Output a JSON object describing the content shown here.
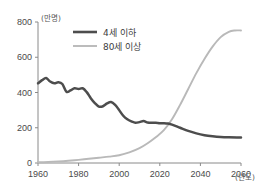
{
  "chart_data": {
    "type": "line",
    "title": "",
    "xlabel": "(년도)",
    "ylabel": "(만명)",
    "xlim": [
      1960,
      2060
    ],
    "ylim": [
      0,
      800
    ],
    "grid": false,
    "legend_position": "top-center",
    "x_ticks": [
      "1960",
      "1980",
      "2000",
      "2020",
      "2040",
      "2060"
    ],
    "x_tick_values": [
      1960,
      1980,
      2000,
      2020,
      2040,
      2060
    ],
    "y_ticks": [
      "0",
      "200",
      "400",
      "600",
      "800"
    ],
    "y_tick_values": [
      0,
      200,
      400,
      600,
      800
    ],
    "series": [
      {
        "name": "4세 이하",
        "color": "#4d4d4d",
        "x": [
          1960,
          1962,
          1964,
          1966,
          1968,
          1970,
          1972,
          1974,
          1976,
          1978,
          1980,
          1982,
          1984,
          1986,
          1988,
          1990,
          1992,
          1994,
          1996,
          1998,
          2000,
          2002,
          2004,
          2006,
          2008,
          2010,
          2012,
          2014,
          2016,
          2018,
          2020,
          2022,
          2024,
          2026,
          2030,
          2034,
          2038,
          2042,
          2046,
          2050,
          2054,
          2058,
          2060
        ],
        "values": [
          452,
          470,
          482,
          462,
          452,
          458,
          448,
          404,
          412,
          424,
          420,
          424,
          402,
          368,
          340,
          320,
          322,
          338,
          346,
          330,
          300,
          268,
          248,
          236,
          228,
          232,
          238,
          230,
          228,
          228,
          226,
          226,
          224,
          218,
          200,
          182,
          168,
          158,
          152,
          148,
          146,
          145,
          145
        ]
      },
      {
        "name": "80세 이상",
        "color": "#b9b9b9",
        "x": [
          1960,
          1965,
          1970,
          1975,
          1980,
          1985,
          1990,
          1995,
          2000,
          2005,
          2010,
          2014,
          2018,
          2022,
          2026,
          2030,
          2034,
          2038,
          2042,
          2046,
          2050,
          2054,
          2057,
          2060
        ],
        "values": [
          4,
          6,
          9,
          13,
          18,
          24,
          30,
          36,
          44,
          60,
          84,
          112,
          146,
          186,
          248,
          330,
          420,
          510,
          590,
          660,
          714,
          744,
          752,
          752
        ]
      }
    ],
    "annotations": [],
    "crossover": {
      "year": 2024,
      "value": 222
    }
  },
  "legend": {
    "entries": [
      {
        "label": "4세 이하",
        "color": "#4d4d4d",
        "width": 2.6
      },
      {
        "label": "80세 이상",
        "color": "#b9b9b9",
        "width": 1.8
      }
    ]
  },
  "axis": {
    "y_unit": "(만명)",
    "x_unit": "(년도)"
  }
}
